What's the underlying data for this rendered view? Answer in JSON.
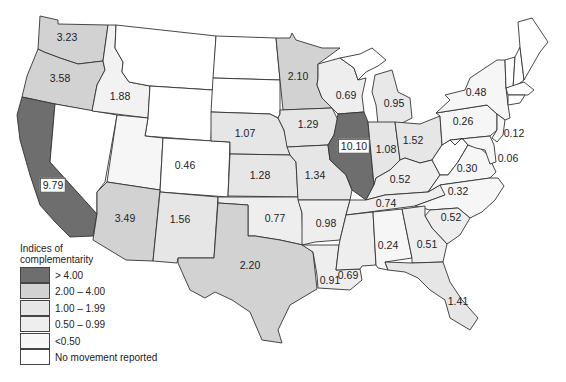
{
  "legend": {
    "title_line1": "Indices of",
    "title_line2": "complementarity",
    "items": [
      {
        "label": "> 4.00",
        "color": "#6e6e6e"
      },
      {
        "label": "2.00 – 4.00",
        "color": "#d2d2d2"
      },
      {
        "label": "1.00 – 1.99",
        "color": "#e6e6e6"
      },
      {
        "label": "0.50 – 0.99",
        "color": "#eeeeee"
      },
      {
        "label": "<0.50",
        "color": "#f6f6f6"
      },
      {
        "label": "No movement reported",
        "color": "#ffffff"
      }
    ]
  },
  "states": {
    "WA": "3.23",
    "OR": "3.58",
    "ID": "1.88",
    "CA": "9.79",
    "AZ": "3.49",
    "UT": "0.46",
    "NM": "1.56",
    "NE": "1.07",
    "KS": "1.28",
    "OK": "0.77",
    "TX": "2.20",
    "MN": "2.10",
    "IA": "1.29",
    "MO": "1.34",
    "AR": "0.98",
    "LA": "0.91",
    "WI": "0.69",
    "IL": "10.10",
    "MI": "0.95",
    "IN": "1.08",
    "OH": "1.52",
    "KY": "0.52",
    "TN": "0.74",
    "MS": "0.69",
    "AL": "0.24",
    "GA": "0.51",
    "FL": "1.41",
    "SC": "0.52",
    "NC": "0.32",
    "VA": "0.30",
    "PA": "0.26",
    "NY": "0.48",
    "NJ": "0.12",
    "DE_MD": "0.06"
  }
}
